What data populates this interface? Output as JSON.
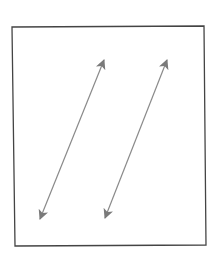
{
  "diagram": {
    "background": "#ffffff",
    "frame": {
      "points": [
        [
          12,
          27
        ],
        [
          204,
          26
        ],
        [
          206,
          245
        ],
        [
          15,
          246
        ]
      ],
      "stroke": "#444444",
      "stroke_width": 1.3
    },
    "arrows": [
      {
        "id": "left-arrow",
        "from": [
          40,
          219
        ],
        "to": [
          104,
          60
        ],
        "heads": "both",
        "stroke": "#8a8a8a",
        "head_fill": "#7a7a7a"
      },
      {
        "id": "right-arrow",
        "from": [
          105,
          218
        ],
        "to": [
          167,
          60
        ],
        "heads": "both",
        "stroke": "#8a8a8a",
        "head_fill": "#7a7a7a"
      }
    ]
  }
}
